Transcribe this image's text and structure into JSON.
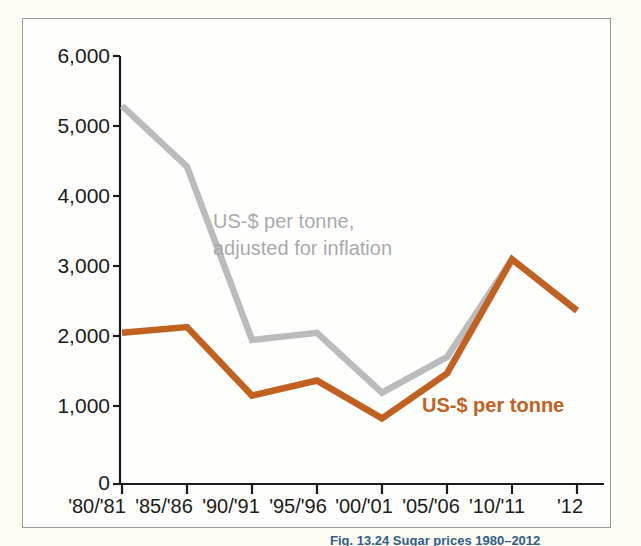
{
  "figure": {
    "background_color": "#fdfcf5",
    "panel_color": "#fefefc",
    "border_color": "#9a9a9a",
    "caption_partial": "Fig. 13.24 Sugar prices 1980–2012"
  },
  "chart_data": {
    "type": "line",
    "title": "",
    "xlabel": "",
    "ylabel": "",
    "grid": false,
    "legend_position": "inline-annotations",
    "ylim": [
      0,
      6000
    ],
    "ytick_labels": [
      "0",
      "1,000",
      "2,000",
      "3,000",
      "4,000",
      "5,000",
      "6,000"
    ],
    "ytick_values": [
      0,
      1000,
      2000,
      3000,
      4000,
      5000,
      6000
    ],
    "categories": [
      "'80/'81",
      "'85/'86",
      "'90/'91",
      "'95/'96",
      "'00/'01",
      "'05/'06",
      "'10/'11",
      "'12"
    ],
    "series": [
      {
        "name": "US-$ per tonne, adjusted for inflation",
        "color": "#b9bbbd",
        "values": [
          5300,
          4450,
          2020,
          2120,
          1280,
          1780,
          3150,
          2430
        ],
        "annotation": {
          "line1": "US-$ per tonne,",
          "line2": "adjusted for inflation"
        }
      },
      {
        "name": "US-$ per tonne",
        "color": "#c2601f",
        "values": [
          2120,
          2200,
          1240,
          1450,
          920,
          1550,
          3150,
          2430
        ],
        "annotation": {
          "line1": "US-$ per tonne"
        }
      }
    ]
  }
}
